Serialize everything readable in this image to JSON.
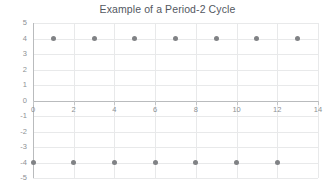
{
  "chart_data": {
    "type": "scatter",
    "title": "Example of a Period-2 Cycle",
    "xlabel": "",
    "ylabel": "",
    "xlim": [
      0,
      14
    ],
    "ylim": [
      -5,
      5
    ],
    "xticks": [
      0,
      2,
      4,
      6,
      8,
      10,
      12,
      14
    ],
    "yticks": [
      5,
      4,
      3,
      2,
      1,
      0,
      -1,
      -2,
      -3,
      -4,
      -5
    ],
    "grid": true,
    "legend": false,
    "legend_position": "none",
    "marker": "circle",
    "marker_color": "#808285",
    "series": [
      {
        "name": "Period-2 orbit",
        "x": [
          0,
          1,
          2,
          3,
          4,
          5,
          6,
          7,
          8,
          9,
          10,
          11,
          12,
          13
        ],
        "values": [
          -4,
          4,
          -4,
          4,
          -4,
          4,
          -4,
          4,
          -4,
          4,
          -4,
          4,
          -4,
          4
        ]
      }
    ]
  },
  "axes": {
    "x_tick_labels": [
      "0",
      "2",
      "4",
      "6",
      "8",
      "10",
      "12",
      "14"
    ],
    "y_tick_labels": [
      "5",
      "4",
      "3",
      "2",
      "1",
      "0",
      "-1",
      "-2",
      "-3",
      "-4",
      "-5"
    ]
  },
  "colors": {
    "marker": "#808285",
    "gridline": "#e8e9ea",
    "axis_line": "#b9bbbd",
    "title_text": "#53585f",
    "tick_text": "#8d9194",
    "background": "#ffffff"
  }
}
